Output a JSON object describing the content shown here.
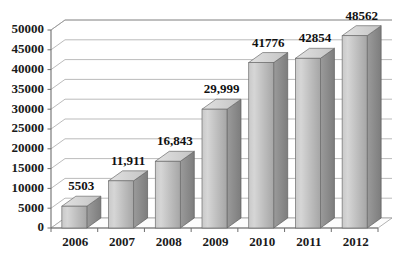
{
  "chart_data": {
    "type": "bar",
    "title": "",
    "subtitle": "",
    "xlabel": "",
    "ylabel": "",
    "categories": [
      "2006",
      "2007",
      "2008",
      "2009",
      "2010",
      "2011",
      "2012"
    ],
    "values": [
      5503,
      11911,
      16843,
      29999,
      41776,
      42854,
      48562
    ],
    "data_labels": [
      "5503",
      "11,911",
      "16,843",
      "29,999",
      "41776",
      "42854",
      "48562"
    ],
    "ylim": [
      0,
      50000
    ],
    "ytick_values": [
      0,
      5000,
      10000,
      15000,
      20000,
      25000,
      30000,
      35000,
      40000,
      45000,
      50000
    ],
    "ytick_labels": [
      "0",
      "5000",
      "10000",
      "15000",
      "20000",
      "25000",
      "30000",
      "35000",
      "40000",
      "45000",
      "50000"
    ],
    "grid": true,
    "legend": false,
    "legend_position": "none",
    "style": "3d-column",
    "colors": {
      "bar_front_light": "#d2d2d2",
      "bar_front_dark": "#a8a8a8",
      "bar_top": "#dcdcdc",
      "bar_side": "#8d8d8d",
      "gridline": "#a9a9a9",
      "axis": "#6e6e6e",
      "text": "#111111",
      "background": "#ffffff",
      "floor": "#fcfcfc"
    }
  }
}
